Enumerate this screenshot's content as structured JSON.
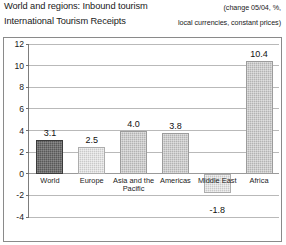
{
  "header": {
    "title": "World and regions: Inbound tourism",
    "subtitle": "International Tourism Receipts",
    "note_line_1": "(change 05/04, %,",
    "note_line_2": "local currencies, constant prices)"
  },
  "chart_data": {
    "type": "bar",
    "title": "World and regions: Inbound tourism",
    "subtitle": "International Tourism Receipts",
    "xlabel": "",
    "ylabel": "",
    "ylim": [
      -4,
      12
    ],
    "yticks": [
      -4,
      -2,
      0,
      2,
      4,
      6,
      8,
      10,
      12
    ],
    "ytick_labels": [
      "-4",
      "-2",
      "0",
      "2",
      "4",
      "6",
      "8",
      "10",
      "12"
    ],
    "grid": true,
    "legend": "none",
    "units": "change 05/04, %, local currencies, constant prices",
    "categories": [
      "World",
      "Europe",
      "Asia and the Pacific",
      "Americas",
      "Middle East",
      "Africa"
    ],
    "values": [
      3.1,
      2.5,
      4.0,
      3.8,
      -1.8,
      10.4
    ],
    "value_labels": [
      "3.1",
      "2.5",
      "4.0",
      "3.8",
      "-1.8",
      "10.4"
    ],
    "bar_styles": [
      "dark",
      "light",
      "medium",
      "medium",
      "light",
      "medium"
    ],
    "colors": {
      "bar_dark": "#585858",
      "bar_medium": "#b3b3b3",
      "bar_light": "#c9c9c9",
      "gridline": "#b9b9b9",
      "axis": "#7d7d7d",
      "frame": "#8a8a8a",
      "text": "#1a1a1a"
    }
  }
}
